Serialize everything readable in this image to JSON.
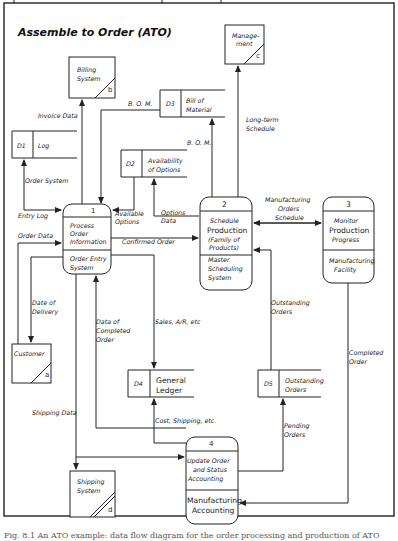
{
  "diagram": {
    "title": "Assemble to Order (ATO)",
    "processes": [
      {
        "id": "1",
        "number": "1",
        "name_lines": [
          "Process",
          "Order",
          "Information"
        ],
        "location_lines": [
          "Order Entry",
          "System"
        ]
      },
      {
        "id": "2",
        "number": "2",
        "name_lines": [
          "Schedule",
          "Production",
          "(Family of",
          "Products)"
        ],
        "location_lines": [
          "Master",
          "Scheduling",
          "System"
        ]
      },
      {
        "id": "3",
        "number": "3",
        "name_lines": [
          "Monitor",
          "Production",
          "Progress"
        ],
        "location_lines": [
          "Manufacturing",
          "Facility"
        ]
      },
      {
        "id": "4",
        "number": "4",
        "name_lines": [
          "Update Order",
          "and Status",
          "Accounting"
        ],
        "location_lines": [
          "Manufacturing",
          "Accounting"
        ]
      }
    ],
    "data_stores": [
      {
        "id": "D1",
        "label": "D1",
        "name_lines": [
          "Log"
        ]
      },
      {
        "id": "D2",
        "label": "D2",
        "name_lines": [
          "Availability",
          "of Options"
        ]
      },
      {
        "id": "D3",
        "label": "D3",
        "name_lines": [
          "Bill of",
          "Material"
        ]
      },
      {
        "id": "D4",
        "label": "D4",
        "name_lines": [
          "General",
          "Ledger"
        ]
      },
      {
        "id": "D5",
        "label": "D5",
        "name_lines": [
          "Outstanding",
          "Orders"
        ]
      }
    ],
    "external_entities": [
      {
        "id": "a",
        "letter": "a",
        "name_lines": [
          "Customer"
        ]
      },
      {
        "id": "b",
        "letter": "b",
        "name_lines": [
          "Billing",
          "System"
        ]
      },
      {
        "id": "c",
        "letter": "c",
        "name_lines": [
          "Manage-",
          "ment"
        ]
      },
      {
        "id": "d",
        "letter": "d",
        "name_lines": [
          "Shipping",
          "System"
        ]
      }
    ],
    "flows": [
      {
        "id": "invoice",
        "label_lines": [
          "Invoice Data"
        ],
        "from": "1",
        "to": "b"
      },
      {
        "id": "bom1",
        "label_lines": [
          "B. O. M."
        ],
        "from": "D3",
        "to": "1"
      },
      {
        "id": "bom2",
        "label_lines": [
          "B. O. M."
        ],
        "from": "2",
        "to": "D3"
      },
      {
        "id": "longterm",
        "label_lines": [
          "Long-term",
          "Schedule"
        ],
        "from": "2",
        "to": "c"
      },
      {
        "id": "ordersys",
        "label_lines": [
          "Order System"
        ],
        "from": "1",
        "to": "D1"
      },
      {
        "id": "entrylog",
        "label_lines": [
          "Entry Log"
        ],
        "from": "D1",
        "to": "1"
      },
      {
        "id": "availopt",
        "label_lines": [
          "Available",
          "Options"
        ],
        "from": "D2",
        "to": "1"
      },
      {
        "id": "optdata",
        "label_lines": [
          "Options",
          "Data"
        ],
        "from": "2",
        "to": "D2"
      },
      {
        "id": "confirmed",
        "label_lines": [
          "Confirmed Order"
        ],
        "from": "1",
        "to": "2"
      },
      {
        "id": "orderdata",
        "label_lines": [
          "Order Data"
        ],
        "from": "a",
        "to": "1"
      },
      {
        "id": "mfgsched",
        "label_lines": [
          "Manufacturing",
          "Orders",
          "Schedule"
        ],
        "from": "2",
        "to": "3"
      },
      {
        "id": "delivery",
        "label_lines": [
          "Date of",
          "Delivery"
        ],
        "from": "1",
        "to": "a"
      },
      {
        "id": "completeddata",
        "label_lines": [
          "Data of",
          "Completed",
          "Order"
        ],
        "from": "4",
        "to": "1"
      },
      {
        "id": "sales",
        "label_lines": [
          "Sales, A/R, etc"
        ],
        "from": "1",
        "to": "D4"
      },
      {
        "id": "outstanding",
        "label_lines": [
          "Outstanding",
          "Orders"
        ],
        "from": "D5",
        "to": "2"
      },
      {
        "id": "completedorder",
        "label_lines": [
          "Completed",
          "Order"
        ],
        "from": "3",
        "to": "4"
      },
      {
        "id": "shipping",
        "label_lines": [
          "Shipping Data"
        ],
        "from": "4",
        "to": "d"
      },
      {
        "id": "cost",
        "label_lines": [
          "Cost, Shipping, etc."
        ],
        "from": "4",
        "to": "D4"
      },
      {
        "id": "pending",
        "label_lines": [
          "Pending",
          "Orders"
        ],
        "from": "4",
        "to": "D5"
      }
    ]
  },
  "caption": "Fig. 8.1 An ATO example: data flow diagram for the order processing and production of ATO"
}
